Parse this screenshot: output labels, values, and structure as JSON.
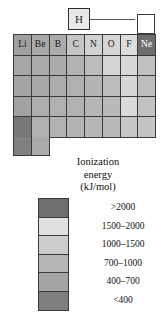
{
  "figure": {
    "type": "periodic-table-heatmap",
    "callout": {
      "symbol": "H",
      "leader_line": "connects hydrogen box to helium cell"
    },
    "floating_cell": {
      "symbol": "He",
      "band": ">2000",
      "color": "#6e6e6e"
    },
    "period_labels_row1": [
      "Li",
      "Be",
      "B",
      "C",
      "N",
      "O",
      "F",
      "Ne"
    ],
    "grid": {
      "columns": 8,
      "rows": 5,
      "tail_row_columns": 2,
      "cells": [
        [
          {
            "symbol": "Li",
            "color": "#a0a0a0"
          },
          {
            "symbol": "Be",
            "color": "#a8a8a8"
          },
          {
            "symbol": "B",
            "color": "#ababab"
          },
          {
            "symbol": "C",
            "color": "#c5c5c5"
          },
          {
            "symbol": "N",
            "color": "#d2d2d2"
          },
          {
            "symbol": "O",
            "color": "#d6d6d6"
          },
          {
            "symbol": "F",
            "color": "#dcdcdc"
          },
          {
            "symbol": "Ne",
            "color": "#6e6e6e"
          }
        ],
        [
          {
            "symbol": "",
            "color": "#a6a6a6"
          },
          {
            "symbol": "",
            "color": "#aaaaaa"
          },
          {
            "symbol": "",
            "color": "#ababab"
          },
          {
            "symbol": "",
            "color": "#b2b2b2"
          },
          {
            "symbol": "",
            "color": "#bcbcbc"
          },
          {
            "symbol": "",
            "color": "#d4d4d4"
          },
          {
            "symbol": "",
            "color": "#d8d8d8"
          },
          {
            "symbol": "",
            "color": "#c0c0c0"
          }
        ],
        [
          {
            "symbol": "",
            "color": "#a4a4a4"
          },
          {
            "symbol": "",
            "color": "#a8a8a8"
          },
          {
            "symbol": "",
            "color": "#acacac"
          },
          {
            "symbol": "",
            "color": "#b0b0b0"
          },
          {
            "symbol": "",
            "color": "#b4b4b4"
          },
          {
            "symbol": "",
            "color": "#bcbcbc"
          },
          {
            "symbol": "",
            "color": "#d6d6d6"
          },
          {
            "symbol": "",
            "color": "#bebebe"
          }
        ],
        [
          {
            "symbol": "",
            "color": "#a2a2a2"
          },
          {
            "symbol": "",
            "color": "#aeaeae"
          },
          {
            "symbol": "",
            "color": "#b0b0b0"
          },
          {
            "symbol": "",
            "color": "#b2b2b2"
          },
          {
            "symbol": "",
            "color": "#b6b6b6"
          },
          {
            "symbol": "",
            "color": "#bababa"
          },
          {
            "symbol": "",
            "color": "#dadada"
          },
          {
            "symbol": "",
            "color": "#c2c2c2"
          }
        ],
        [
          {
            "symbol": "",
            "color": "#787878"
          },
          {
            "symbol": "",
            "color": "#b0b0b0"
          },
          {
            "symbol": "",
            "color": "#b2b2b2"
          },
          {
            "symbol": "",
            "color": "#b4b4b4"
          },
          {
            "symbol": "",
            "color": "#b6b6b6"
          },
          {
            "symbol": "",
            "color": "#bababa"
          },
          {
            "symbol": "",
            "color": "#c6c6c6"
          },
          {
            "symbol": "",
            "color": "#c4c4c4"
          }
        ]
      ],
      "tail_row": [
        {
          "symbol": "",
          "color": "#808080"
        },
        {
          "symbol": "",
          "color": "#aaaaaa"
        }
      ]
    }
  },
  "legend": {
    "title_line1": "Ionization",
    "title_line2": "energy",
    "title_line3": "(kJ/mol)",
    "entries": [
      {
        "label": ">2000",
        "color": "#6e6e6e"
      },
      {
        "label": "1500–2000",
        "color": "#e0e0e0"
      },
      {
        "label": "1000–1500",
        "color": "#cdcdcd"
      },
      {
        "label": "700–1000",
        "color": "#b6b6b6"
      },
      {
        "label": "400–700",
        "color": "#a4a4a4"
      },
      {
        "label": "<400",
        "color": "#7e7e7e"
      }
    ]
  }
}
